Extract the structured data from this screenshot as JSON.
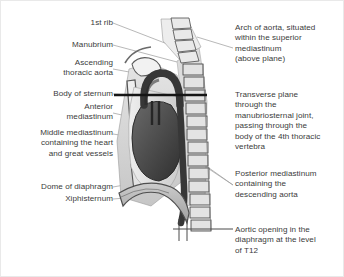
{
  "figure": {
    "background_color": "#ffffff",
    "text_color": "#3b3b3b",
    "leader_line_color": "#9a9a9a",
    "plane_line_color": "#1a1a1a"
  },
  "labels_left": [
    {
      "id": "first-rib",
      "text": "1st rib"
    },
    {
      "id": "manubrium",
      "text": "Manubrium"
    },
    {
      "id": "ascending-thoracic-aorta",
      "text": "Ascending\nthoracic aorta"
    },
    {
      "id": "body-of-sternum",
      "text": "Body of sternum"
    },
    {
      "id": "anterior-mediastinum",
      "text": "Anterior\nmediastinum"
    },
    {
      "id": "middle-mediastinum",
      "text": "Middle mediastinum\ncontaining the heart\nand great vessels"
    },
    {
      "id": "dome-of-diaphragm",
      "text": "Dome of diaphragm"
    },
    {
      "id": "xiphisternum",
      "text": "Xiphisternum"
    }
  ],
  "labels_right": [
    {
      "id": "arch-of-aorta",
      "text": "Arch of aorta, situated\nwithin the superior\nmediastinum\n(above plane)"
    },
    {
      "id": "transverse-plane",
      "text": "Transverse plane\nthrough the\nmanubriosternal joint,\npassing through the\nbody of the 4th thoracic\nvertebra"
    },
    {
      "id": "posterior-mediastinum",
      "text": "Posterior mediastinum\ncontaining the\ndescending aorta"
    },
    {
      "id": "aortic-opening",
      "text": "Aortic opening in the\ndiaphragm at the level\nof T12"
    }
  ],
  "anatomy": {
    "structures": [
      "cervical vertebrae",
      "thoracic vertebral column",
      "manubrium",
      "body of sternum",
      "xiphisternum",
      "first rib",
      "aortic arch",
      "ascending aorta",
      "descending aorta",
      "heart",
      "diaphragm"
    ],
    "colors": {
      "bone_light": "#e6e6e6",
      "bone_mid": "#cfcfcf",
      "soft_tissue": "#d6d6d6",
      "aorta_dark": "#373737",
      "heart_dark": "#4a4a4a",
      "outline": "#555555"
    },
    "plane_lines": [
      {
        "id": "transverse-plane-line",
        "level": "manubriosternal joint / T4"
      },
      {
        "id": "aortic-opening-line",
        "level": "T12"
      }
    ]
  }
}
